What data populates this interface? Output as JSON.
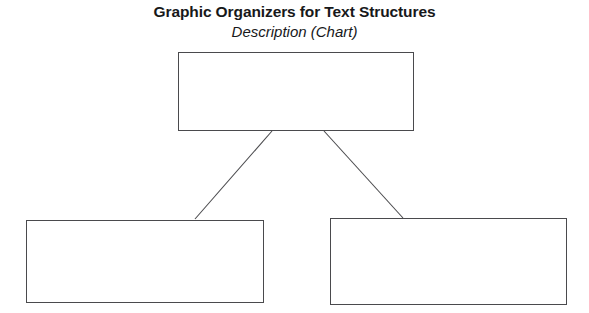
{
  "page": {
    "title": "Graphic Organizers for Text Structures",
    "subtitle": "Description (Chart)",
    "background_color": "#ffffff",
    "line_color": "#4a4a4d",
    "text_color": "#17181a"
  },
  "organizer": {
    "type": "description-chart",
    "top_box": {
      "label": "main-topic-box",
      "text": ""
    },
    "bottom_boxes": [
      {
        "label": "detail-box-left",
        "text": ""
      },
      {
        "label": "detail-box-right",
        "text": ""
      }
    ],
    "connectors": [
      {
        "label": "connector-top-to-left",
        "from": [
          272,
          131
        ],
        "to": [
          195,
          219
        ]
      },
      {
        "label": "connector-top-to-right",
        "from": [
          324,
          131
        ],
        "to": [
          403,
          218
        ]
      }
    ]
  }
}
